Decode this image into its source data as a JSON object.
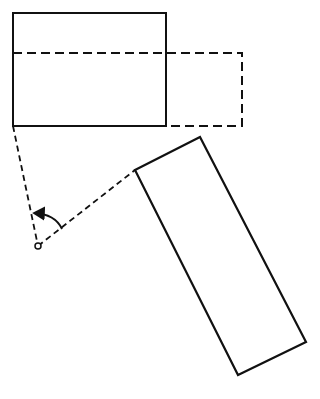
{
  "diagram": {
    "colors": {
      "stroke": "#111111",
      "background": "#ffffff"
    },
    "original_rect": {
      "x1": 13,
      "y1": 13,
      "x2": 166,
      "y2": 126
    },
    "dashed_rect": {
      "x1": 13,
      "y1": 53,
      "x2": 242,
      "y2": 126
    },
    "pivot": {
      "x": 38,
      "y": 246,
      "r": 3
    },
    "rotated_rect": {
      "points": "135,170 200,137 306,342 238,375"
    },
    "construction_lines": [
      {
        "from": [
          13,
          126
        ],
        "to": [
          38,
          246
        ]
      },
      {
        "from": [
          38,
          246
        ],
        "to": [
          135,
          170
        ]
      }
    ],
    "rotation_arrow": {
      "start": [
        62,
        229
      ],
      "end": [
        33,
        213
      ]
    }
  }
}
